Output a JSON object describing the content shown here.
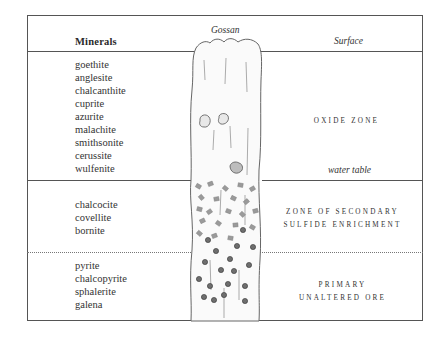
{
  "diagram": {
    "title": "Minerals",
    "labels": {
      "gossan": "Gossan",
      "surface": "Surface",
      "water_table": "water table"
    },
    "zones": [
      {
        "name_lines": [
          "OXIDE ZONE"
        ],
        "minerals": [
          "goethite",
          "anglesite",
          "chalcanthite",
          "cuprite",
          "azurite",
          "malachite",
          "smithsonite",
          "cerussite",
          "wulfenite"
        ]
      },
      {
        "name_lines": [
          "ZONE OF SECONDARY",
          "SULFIDE ENRICHMENT"
        ],
        "minerals": [
          "chalcocite",
          "covellite",
          "bornite"
        ]
      },
      {
        "name_lines": [
          "PRIMARY",
          "UNALTERED ORE"
        ],
        "minerals": [
          "pyrite",
          "chalcopyrite",
          "sphalerite",
          "galena"
        ]
      }
    ],
    "colors": {
      "line": "#555555",
      "text": "#333333",
      "vein_fill": "#fafafa",
      "grain_fill": "#9a9a9a",
      "sphere_fill": "#777777"
    }
  }
}
